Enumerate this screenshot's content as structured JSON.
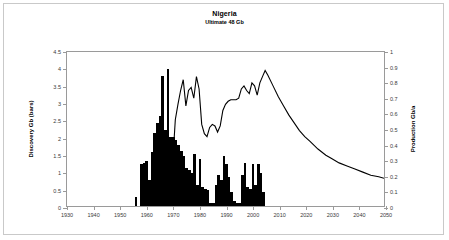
{
  "chart_data": {
    "type": "bar",
    "title": "Nigeria",
    "subtitle": "Ultimate 48 Gb",
    "xlabel": "",
    "ylabel": "Discovery Gb (bars)",
    "y2label": "Production Gb/a",
    "xlim": [
      1930,
      2050
    ],
    "ylim": [
      0,
      4.5
    ],
    "y2lim": [
      0,
      1
    ],
    "grid": false,
    "legend": null,
    "xticks": [
      1930,
      1940,
      1950,
      1960,
      1970,
      1980,
      1990,
      2000,
      2010,
      2020,
      2030,
      2040,
      2050
    ],
    "yticks": [
      0,
      0.5,
      1,
      1.5,
      2,
      2.5,
      3,
      3.5,
      4,
      4.5
    ],
    "y2ticks": [
      0,
      0.1,
      0.2,
      0.3,
      0.4,
      0.5,
      0.6,
      0.7,
      0.8,
      0.9,
      1
    ],
    "xtick_labels": [
      "1930",
      "1940",
      "1950",
      "1960",
      "1970",
      "1980",
      "1990",
      "2000",
      "2010",
      "2020",
      "2030",
      "2040",
      "2050"
    ],
    "ytick_labels": [
      "0",
      "0.5",
      "1",
      "1.5",
      "2",
      "2.5",
      "3",
      "3.5",
      "4",
      "4.5"
    ],
    "y2tick_labels": [
      "0",
      "0.1",
      "0.2",
      "0.3",
      "0.4",
      "0.5",
      "0.6",
      "0.7",
      "0.8",
      "0.9",
      "1"
    ],
    "series": [
      {
        "name": "Discovery Gb (bars)",
        "type": "bar",
        "axis": "left",
        "color": "#000000",
        "x": [
          1956,
          1957,
          1958,
          1959,
          1960,
          1961,
          1962,
          1963,
          1964,
          1965,
          1966,
          1967,
          1968,
          1969,
          1970,
          1971,
          1972,
          1973,
          1974,
          1975,
          1976,
          1977,
          1978,
          1979,
          1980,
          1981,
          1982,
          1983,
          1984,
          1985,
          1986,
          1987,
          1988,
          1989,
          1990,
          1991,
          1992,
          1993,
          1994,
          1995,
          1996,
          1997,
          1998,
          1999,
          2000,
          2001,
          2002,
          2003,
          2004
        ],
        "values": [
          0.25,
          0.0,
          1.2,
          1.25,
          1.3,
          0.75,
          1.55,
          2.1,
          2.4,
          2.6,
          3.75,
          2.2,
          3.95,
          2.0,
          2.0,
          1.9,
          1.75,
          1.6,
          1.45,
          1.1,
          1.05,
          0.95,
          1.5,
          0.6,
          1.35,
          0.55,
          0.5,
          0.45,
          0.1,
          0.1,
          0.6,
          0.9,
          0.75,
          1.45,
          1.2,
          0.85,
          0.4,
          0.15,
          0.1,
          0.1,
          0.9,
          1.25,
          0.55,
          0.5,
          1.2,
          0.6,
          1.2,
          0.95,
          0.4
        ]
      },
      {
        "name": "Production Gb/a",
        "type": "line",
        "axis": "right",
        "color": "#000000",
        "x": [
          1958,
          1960,
          1962,
          1964,
          1966,
          1968,
          1970,
          1971,
          1972,
          1973,
          1974,
          1975,
          1976,
          1977,
          1978,
          1979,
          1980,
          1981,
          1982,
          1983,
          1984,
          1985,
          1986,
          1987,
          1988,
          1989,
          1990,
          1991,
          1992,
          1993,
          1994,
          1995,
          1996,
          1997,
          1998,
          1999,
          2000,
          2001,
          2002,
          2003,
          2004,
          2005,
          2006,
          2008,
          2010,
          2012,
          2014,
          2016,
          2018,
          2020,
          2022,
          2025,
          2028,
          2030,
          2033,
          2036,
          2039,
          2042,
          2045,
          2048,
          2050
        ],
        "values": [
          0.0,
          0.02,
          0.05,
          0.08,
          0.14,
          0.12,
          0.28,
          0.56,
          0.66,
          0.75,
          0.82,
          0.65,
          0.75,
          0.77,
          0.7,
          0.84,
          0.76,
          0.53,
          0.47,
          0.45,
          0.51,
          0.53,
          0.52,
          0.48,
          0.52,
          0.62,
          0.66,
          0.68,
          0.69,
          0.69,
          0.69,
          0.7,
          0.76,
          0.78,
          0.75,
          0.73,
          0.8,
          0.78,
          0.72,
          0.8,
          0.84,
          0.88,
          0.85,
          0.78,
          0.71,
          0.65,
          0.59,
          0.54,
          0.49,
          0.45,
          0.42,
          0.37,
          0.33,
          0.31,
          0.28,
          0.26,
          0.24,
          0.22,
          0.2,
          0.19,
          0.18
        ]
      }
    ]
  }
}
